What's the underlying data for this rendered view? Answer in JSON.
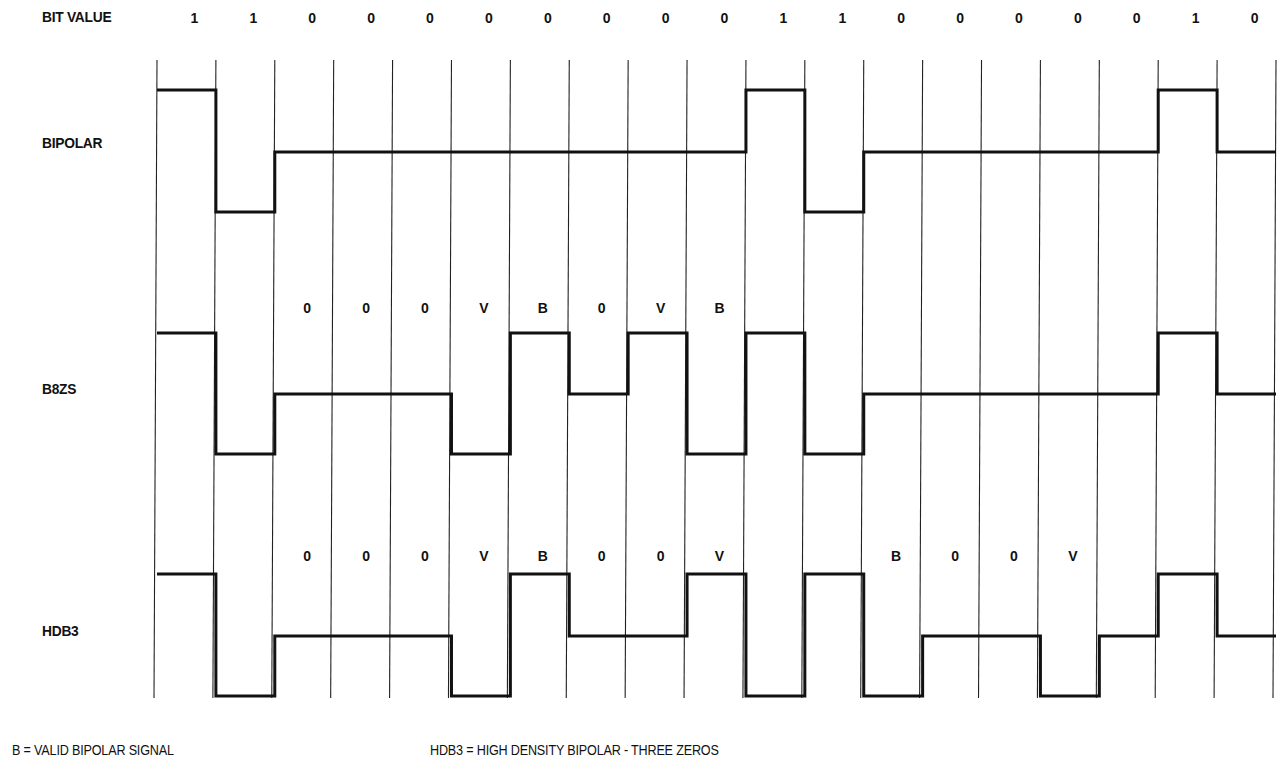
{
  "title_label": "BIT VALUE",
  "bits": [
    "1",
    "1",
    "0",
    "0",
    "0",
    "0",
    "0",
    "0",
    "0",
    "0",
    "1",
    "1",
    "0",
    "0",
    "0",
    "0",
    "0",
    "1",
    "0"
  ],
  "rows": [
    {
      "name": "BIPOLAR",
      "levels": [
        1,
        -1,
        0,
        0,
        0,
        0,
        0,
        0,
        0,
        0,
        1,
        -1,
        0,
        0,
        0,
        0,
        0,
        1,
        0
      ],
      "annotations": []
    },
    {
      "name": "B8ZS",
      "levels": [
        1,
        -1,
        0,
        0,
        0,
        -1,
        1,
        0,
        1,
        -1,
        1,
        -1,
        0,
        0,
        0,
        0,
        0,
        1,
        0
      ],
      "annotations": [
        {
          "bit": 2,
          "text": "0"
        },
        {
          "bit": 3,
          "text": "0"
        },
        {
          "bit": 4,
          "text": "0"
        },
        {
          "bit": 5,
          "text": "V"
        },
        {
          "bit": 6,
          "text": "B"
        },
        {
          "bit": 7,
          "text": "0"
        },
        {
          "bit": 8,
          "text": "V"
        },
        {
          "bit": 9,
          "text": "B"
        }
      ]
    },
    {
      "name": "HDB3",
      "levels": [
        1,
        -1,
        0,
        0,
        0,
        -1,
        1,
        0,
        0,
        1,
        -1,
        1,
        -1,
        0,
        0,
        -1,
        0,
        1,
        0
      ],
      "annotations": [
        {
          "bit": 2,
          "text": "0"
        },
        {
          "bit": 3,
          "text": "0"
        },
        {
          "bit": 4,
          "text": "0"
        },
        {
          "bit": 5,
          "text": "V"
        },
        {
          "bit": 6,
          "text": "B"
        },
        {
          "bit": 7,
          "text": "0"
        },
        {
          "bit": 8,
          "text": "0"
        },
        {
          "bit": 9,
          "text": "V"
        },
        {
          "bit": 12,
          "text": "B"
        },
        {
          "bit": 13,
          "text": "0"
        },
        {
          "bit": 14,
          "text": "0"
        },
        {
          "bit": 15,
          "text": "V"
        }
      ]
    }
  ],
  "footer": {
    "legend_b": "B = VALID BIPOLAR SIGNAL",
    "legend_hdb3": "HDB3 = HIGH DENSITY BIPOLAR - THREE ZEROS"
  },
  "colors": {
    "line": "#111111",
    "grid": "#222222",
    "background": "#ffffff"
  }
}
